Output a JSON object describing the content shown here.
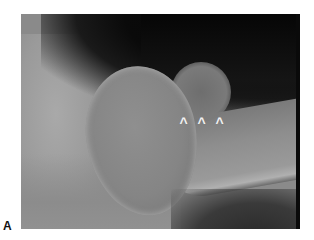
{
  "figure": {
    "panel_label": "A",
    "arrowheads": [
      {
        "glyph": "^",
        "x": 181,
        "y": 124
      },
      {
        "glyph": "^",
        "x": 198,
        "y": 124
      },
      {
        "glyph": "^",
        "x": 216,
        "y": 124
      }
    ]
  }
}
